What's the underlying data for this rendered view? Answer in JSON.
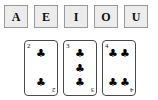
{
  "letters": {
    "tiles": [
      {
        "label": "A",
        "name": "letter-tile-a"
      },
      {
        "label": "E",
        "name": "letter-tile-e"
      },
      {
        "label": "I",
        "name": "letter-tile-i"
      },
      {
        "label": "O",
        "name": "letter-tile-o"
      },
      {
        "label": "U",
        "name": "letter-tile-u"
      }
    ]
  },
  "cards": [
    {
      "rank": "2",
      "suit_symbol": "♣",
      "suit_name": "clubs",
      "pip_count": 2,
      "layout": "column"
    },
    {
      "rank": "3",
      "suit_symbol": "♣",
      "suit_name": "clubs",
      "pip_count": 3,
      "layout": "column"
    },
    {
      "rank": "4",
      "suit_symbol": "♣",
      "suit_name": "clubs",
      "pip_count": 4,
      "layout": "grid-2x2"
    }
  ],
  "colors": {
    "tile_fill": "#ececec",
    "tile_border": "#9a9a9a",
    "card_border": "#4a4a4a",
    "card_face": "#ffffff",
    "ink": "#111111",
    "page_background": "#ffffff"
  }
}
